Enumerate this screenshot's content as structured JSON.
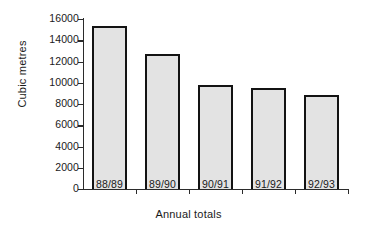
{
  "chart_data": {
    "type": "bar",
    "title": "",
    "categories": [
      "88/89",
      "89/90",
      "90/91",
      "91/92",
      "92/93"
    ],
    "values": [
      15300,
      12750,
      9800,
      9500,
      8850
    ],
    "xlabel": "Annual totals",
    "ylabel": "Cubic metres",
    "ylim": [
      0,
      16000
    ],
    "ytick_labels": [
      "0",
      "2000",
      "4000",
      "6000",
      "8000",
      "10000",
      "12000",
      "14000",
      "16000"
    ],
    "ytick_values": [
      0,
      2000,
      4000,
      6000,
      8000,
      10000,
      12000,
      14000,
      16000
    ],
    "grid": false,
    "legend": null,
    "bar_fill_color": "#e3e3e3",
    "bar_edge_color": "#131313",
    "axis_color": "#2b2b2b",
    "background_color": "#ffffff"
  }
}
